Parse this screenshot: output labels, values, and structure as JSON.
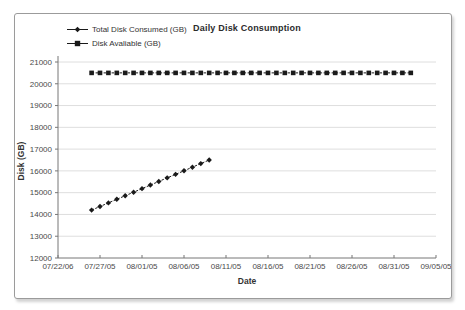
{
  "panel": {
    "background": "#ffffff",
    "border_color": "#9b9b9b"
  },
  "chart_data": {
    "type": "line",
    "title": "Daily Disk Consumption",
    "xlabel": "Date",
    "ylabel": "Disk (GB)",
    "grid": true,
    "legend_position": "top-left",
    "y_axis": {
      "min": 12000,
      "max": 21000,
      "step": 1000,
      "tick_labels": [
        "12000",
        "13000",
        "14000",
        "15000",
        "16000",
        "17000",
        "18000",
        "19000",
        "20000",
        "21000"
      ]
    },
    "x_axis": {
      "range_start": "07/22/05",
      "range_end": "09/05/05",
      "tick_labels": [
        "07/22/06",
        "07/27/05",
        "08/01/05",
        "08/06/05",
        "08/11/05",
        "08/16/05",
        "08/21/05",
        "08/26/05",
        "08/31/05",
        "09/05/05"
      ]
    },
    "colors": {
      "series": "#1a1a1a",
      "grid": "#dedede",
      "axis": "#777777",
      "text": "#4a4a4a"
    },
    "series": [
      {
        "name": "Total Disk Consumed (GB)",
        "marker": "diamond",
        "dates": [
          "07/26/05",
          "07/27/05",
          "07/28/05",
          "07/29/05",
          "07/30/05",
          "07/31/05",
          "08/01/05",
          "08/02/05",
          "08/03/05",
          "08/04/05",
          "08/05/05",
          "08/06/05",
          "08/07/05",
          "08/08/05",
          "08/09/05"
        ],
        "values": [
          14200,
          14365,
          14530,
          14695,
          14860,
          15020,
          15185,
          15350,
          15515,
          15680,
          15840,
          16005,
          16170,
          16335,
          16500
        ]
      },
      {
        "name": "Disk Avaliable (GB)",
        "marker": "square",
        "dates": [
          "07/26/05",
          "07/27/05",
          "07/28/05",
          "07/29/05",
          "07/30/05",
          "07/31/05",
          "08/01/05",
          "08/02/05",
          "08/03/05",
          "08/04/05",
          "08/05/05",
          "08/06/05",
          "08/07/05",
          "08/08/05",
          "08/09/05",
          "08/10/05",
          "08/11/05",
          "08/12/05",
          "08/13/05",
          "08/14/05",
          "08/15/05",
          "08/16/05",
          "08/17/05",
          "08/18/05",
          "08/19/05",
          "08/20/05",
          "08/21/05",
          "08/22/05",
          "08/23/05",
          "08/24/05",
          "08/25/05",
          "08/26/05",
          "08/27/05",
          "08/28/05",
          "08/29/05",
          "08/30/05",
          "08/31/05",
          "09/01/05",
          "09/02/05"
        ],
        "values": [
          20500,
          20500,
          20500,
          20500,
          20500,
          20500,
          20500,
          20500,
          20500,
          20500,
          20500,
          20500,
          20500,
          20500,
          20500,
          20500,
          20500,
          20500,
          20500,
          20500,
          20500,
          20500,
          20500,
          20500,
          20500,
          20500,
          20500,
          20500,
          20500,
          20500,
          20500,
          20500,
          20500,
          20500,
          20500,
          20500,
          20500,
          20500,
          20500
        ]
      }
    ]
  }
}
